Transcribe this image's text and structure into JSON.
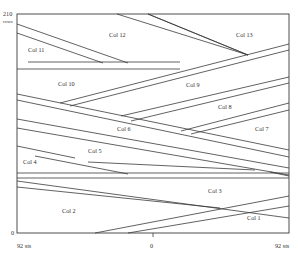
{
  "axes": {
    "y_top_value": "210",
    "y_top_unit": "rows",
    "y_bottom_value": "0",
    "x_left_label": "92 sts",
    "x_center_label": "0",
    "x_right_label": "92 sts"
  },
  "columns": [
    {
      "id": "col1",
      "label": "Col 1",
      "x": 247,
      "y": 218
    },
    {
      "id": "col2",
      "label": "Col 2",
      "x": 62,
      "y": 213
    },
    {
      "id": "col3",
      "label": "Col 3",
      "x": 208,
      "y": 193
    },
    {
      "id": "col4",
      "label": "Col 4",
      "x": 23,
      "y": 164
    },
    {
      "id": "col5",
      "label": "Col 5",
      "x": 88,
      "y": 153
    },
    {
      "id": "col6",
      "label": "Col 6",
      "x": 117,
      "y": 131
    },
    {
      "id": "col7",
      "label": "Col 7",
      "x": 255,
      "y": 131
    },
    {
      "id": "col8",
      "label": "Col 8",
      "x": 218,
      "y": 109
    },
    {
      "id": "col9",
      "label": "Col 9",
      "x": 186,
      "y": 87
    },
    {
      "id": "col10",
      "label": "Col 10",
      "x": 58,
      "y": 86
    },
    {
      "id": "col11",
      "label": "Col 11",
      "x": 28,
      "y": 52
    },
    {
      "id": "col12",
      "label": "Col 12",
      "x": 109,
      "y": 37
    },
    {
      "id": "col13",
      "label": "Col 13",
      "x": 236,
      "y": 37
    }
  ],
  "colors": {
    "line": "#3a3a3a",
    "text": "#333333",
    "background": "#ffffff"
  }
}
